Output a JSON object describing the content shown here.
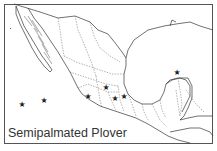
{
  "map": {
    "title": "Semipalmated Plover",
    "region": "Mexico and Central America",
    "marker_icon": "star-icon",
    "marker_glyph": "★",
    "markers": [
      {
        "label": "record-1",
        "x": 22,
        "y": 105
      },
      {
        "label": "record-2",
        "x": 44,
        "y": 101
      },
      {
        "label": "record-3",
        "x": 88,
        "y": 97
      },
      {
        "label": "record-4",
        "x": 106,
        "y": 88
      },
      {
        "label": "record-5",
        "x": 115,
        "y": 99
      },
      {
        "label": "record-6",
        "x": 124,
        "y": 97
      },
      {
        "label": "record-7",
        "x": 177,
        "y": 73
      }
    ]
  }
}
